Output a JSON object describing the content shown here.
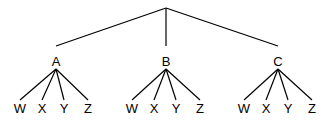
{
  "diagram": {
    "type": "tree",
    "root": {
      "label": "",
      "x": 166,
      "y": 8
    },
    "level1": [
      {
        "label": "A",
        "x": 56,
        "y": 56,
        "children": [
          {
            "label": "W",
            "x": 20
          },
          {
            "label": "X",
            "x": 42
          },
          {
            "label": "Y",
            "x": 64
          },
          {
            "label": "Z",
            "x": 88
          }
        ]
      },
      {
        "label": "B",
        "x": 166,
        "y": 56,
        "children": [
          {
            "label": "W",
            "x": 132
          },
          {
            "label": "X",
            "x": 154
          },
          {
            "label": "Y",
            "x": 176
          },
          {
            "label": "Z",
            "x": 200
          }
        ]
      },
      {
        "label": "C",
        "x": 278,
        "y": 56,
        "children": [
          {
            "label": "W",
            "x": 244
          },
          {
            "label": "X",
            "x": 266
          },
          {
            "label": "Y",
            "x": 288
          },
          {
            "label": "Z",
            "x": 312
          }
        ]
      }
    ],
    "leaf_y": 102,
    "line_color": "#000000"
  }
}
